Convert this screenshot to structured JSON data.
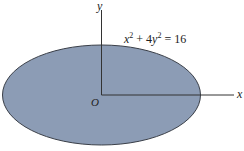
{
  "figure": {
    "equation_parts": {
      "x": "x",
      "sup1": "2",
      "plus": " + 4",
      "y": "y",
      "sup2": "2",
      "rest": " = 16"
    },
    "equation": "x^2 + 4y^2 = 16",
    "axis_labels": {
      "x": "x",
      "y": "y",
      "origin": "O"
    },
    "colors": {
      "fill": "#8c9cb5",
      "stroke": "#3a3f48",
      "axis": "#333333"
    }
  }
}
